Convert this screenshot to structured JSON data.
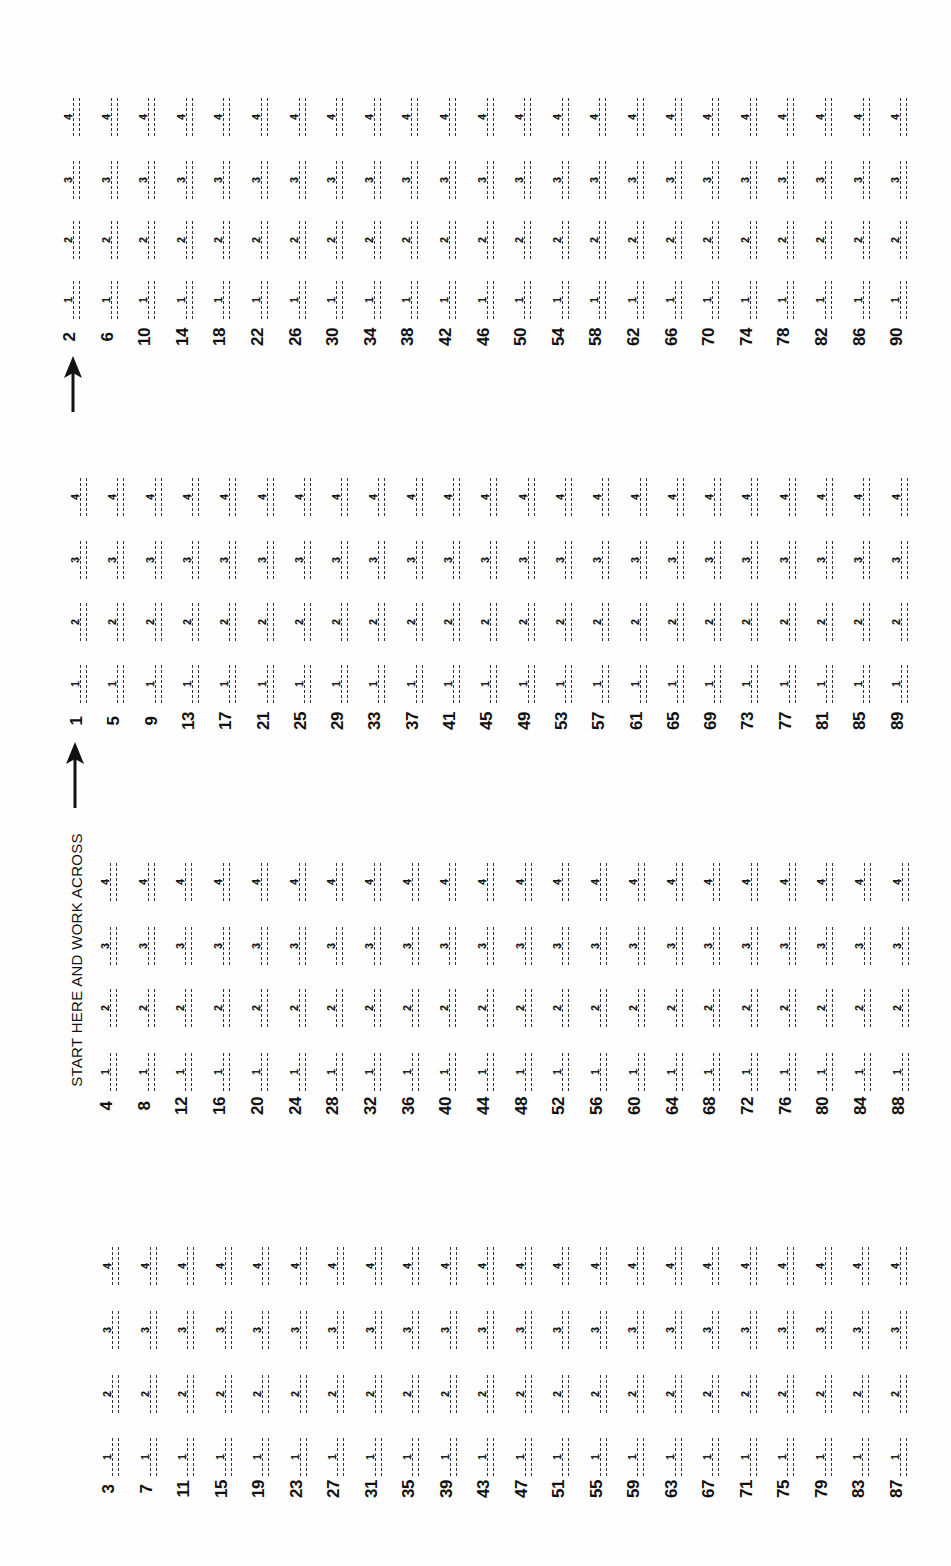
{
  "sheet": {
    "instruction": "START HERE AND WORK ACROSS",
    "choices": [
      "1",
      "2",
      "3",
      "4"
    ],
    "groups": [
      {
        "id": "A",
        "questions": [
          "2",
          "6",
          "10",
          "14",
          "18",
          "22",
          "26",
          "30",
          "34",
          "38",
          "42",
          "46",
          "50",
          "54",
          "58",
          "62",
          "66",
          "70",
          "74",
          "78",
          "82",
          "86",
          "90"
        ]
      },
      {
        "id": "B",
        "questions": [
          "1",
          "5",
          "9",
          "13",
          "17",
          "21",
          "25",
          "29",
          "33",
          "37",
          "41",
          "45",
          "49",
          "53",
          "57",
          "61",
          "65",
          "69",
          "73",
          "77",
          "81",
          "85",
          "89"
        ]
      },
      {
        "id": "C",
        "questions": [
          "4",
          "8",
          "12",
          "16",
          "20",
          "24",
          "28",
          "32",
          "36",
          "40",
          "44",
          "48",
          "52",
          "56",
          "60",
          "64",
          "68",
          "72",
          "76",
          "80",
          "84",
          "88"
        ]
      },
      {
        "id": "D",
        "questions": [
          "3",
          "7",
          "11",
          "15",
          "19",
          "23",
          "27",
          "31",
          "35",
          "39",
          "43",
          "47",
          "51",
          "55",
          "59",
          "63",
          "67",
          "71",
          "75",
          "79",
          "83",
          "87"
        ]
      }
    ],
    "arrows": [
      "arrow-up-icon",
      "arrow-up-icon"
    ],
    "ink_color": "#111111",
    "paper_color": "#fefefe"
  }
}
